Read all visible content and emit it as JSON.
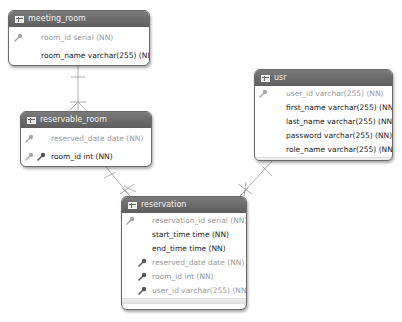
{
  "diagram": {
    "colors": {
      "header": "#6a6a6a",
      "header_text": "#f2f2f2",
      "pk_text": "#9a9a9a",
      "col_text": "#222222",
      "fk_key": "#555555",
      "pk_key": "#a8a8a8",
      "line": "#9a9a9a"
    },
    "entities": {
      "meeting_room": {
        "name": "meeting_room",
        "columns": [
          {
            "text": "room_id serial (NN)",
            "key": "pk"
          },
          {
            "text": "room_name varchar(255) (NN)",
            "key": "none"
          }
        ]
      },
      "reservable_room": {
        "name": "reservable_room",
        "columns": [
          {
            "text": "reserved_date date (NN)",
            "key": "pk"
          },
          {
            "text": "room_id int (NN)",
            "key": "pk+fk"
          }
        ]
      },
      "user": {
        "name": "usr",
        "columns": [
          {
            "text": "user_id varchar(255) (NN)",
            "key": "pk"
          },
          {
            "text": "first_name varchar(255) (NN)",
            "key": "none"
          },
          {
            "text": "last_name varchar(255) (NN)",
            "key": "none"
          },
          {
            "text": "password varchar(255) (NN)",
            "key": "none"
          },
          {
            "text": "role_name varchar(255) (NN)",
            "key": "none"
          }
        ]
      },
      "reservation": {
        "name": "reservation",
        "columns": [
          {
            "text": "reservation_id serial (NN)",
            "key": "pk"
          },
          {
            "text": "start_time time (NN)",
            "key": "none"
          },
          {
            "text": "end_time time (NN)",
            "key": "none"
          },
          {
            "text": "reserved_date date (NN)",
            "key": "fk"
          },
          {
            "text": "room_id int (NN)",
            "key": "fk"
          },
          {
            "text": "user_id varchar(255) (NN)",
            "key": "fk"
          }
        ]
      }
    },
    "relationships": [
      {
        "from": "meeting_room",
        "to": "reservable_room",
        "type": "one-to-many"
      },
      {
        "from": "reservable_room",
        "to": "reservation",
        "type": "one-to-many"
      },
      {
        "from": "usr",
        "to": "reservation",
        "type": "one-to-many"
      }
    ]
  }
}
